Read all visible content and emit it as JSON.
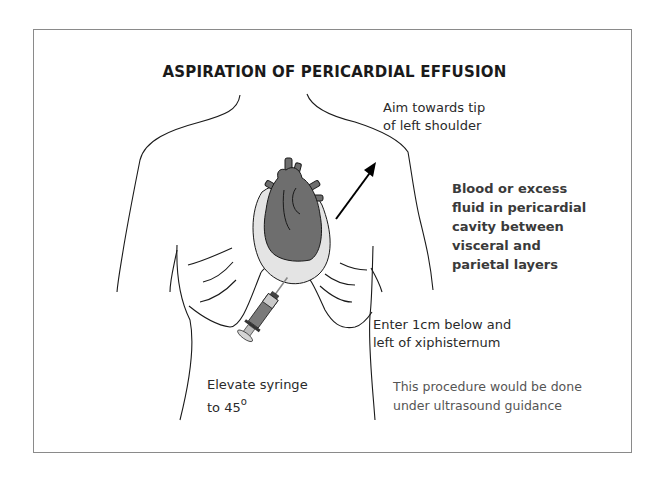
{
  "figure": {
    "title": "ASPIRATION OF PERICARDIAL EFFUSION",
    "labels": {
      "aim": "Aim towards tip\nof left shoulder",
      "blood": "Blood or excess\nfluid in pericardial\ncavity between\nvisceral and\nparietal layers",
      "enter": "Enter 1cm below and\nleft of xiphisternum",
      "elevate_line1": "Elevate syringe",
      "elevate_line2": "to 45",
      "elevate_degree": "o",
      "note": "This procedure would be done\nunder ultrasound guidance"
    },
    "colors": {
      "heart": "#6e6e6e",
      "pericardium": "#e4e4e4",
      "outline": "#1a1a1a",
      "frame": "#8a8a8a"
    }
  }
}
